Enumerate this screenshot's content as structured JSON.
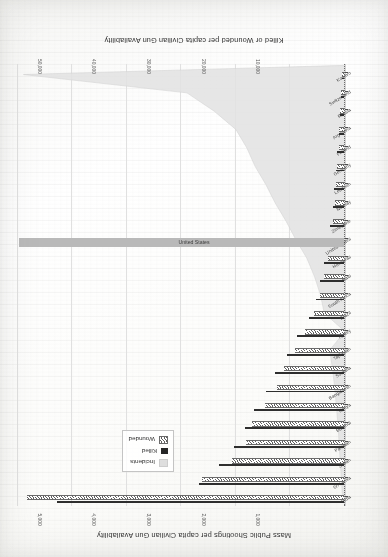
{
  "chart_data": {
    "type": "bar",
    "title": "",
    "orientation": "horizontal",
    "rotated_180": true,
    "grid": true,
    "legend_position": "upper-right",
    "axes": {
      "primary_bottom": {
        "label": "Killed or Wounded per capita  Civilian Gun Availability",
        "ticks": [
          "10,000",
          "20,000",
          "30,000",
          "40,000",
          "50,000",
          "60,000"
        ],
        "tick_values": [
          10000,
          20000,
          30000,
          40000,
          50000,
          60000
        ],
        "lim": [
          0,
          60000
        ]
      },
      "secondary_top": {
        "label": "Mass Public Shootings per capita Civilian Gun Availability",
        "ticks": [
          "1,000",
          "2,000",
          "3,000",
          "4,000",
          "5,000",
          "6,000"
        ],
        "tick_values": [
          1000,
          2000,
          3000,
          4000,
          5000,
          6000
        ],
        "lim": [
          0,
          6000
        ]
      },
      "category": {
        "label": ""
      }
    },
    "categories": [
      "India",
      "Sri Lanka",
      "Sudan",
      "Pakistan",
      "Burundi",
      "Kenya",
      "Bangladesh",
      "Somalia",
      "Tajikistan",
      "Turkey",
      "Brazil",
      "South Africa",
      "Haiti",
      "Honduras",
      "United States",
      "Zimbabwe",
      "Norway",
      "Lebanon",
      "Germany",
      "Finland",
      "Argentina",
      "Russia",
      "Switzerland",
      "Kosovo"
    ],
    "series": [
      {
        "name": "Killed",
        "axis": "primary_bottom",
        "marker": "black-bar",
        "color": "#2e2e2e",
        "values": [
          52500,
          26500,
          22800,
          20100,
          18200,
          16500,
          14300,
          12600,
          10500,
          8600,
          6400,
          5200,
          4300,
          3600,
          0,
          2500,
          2100,
          1800,
          1500,
          1200,
          1000,
          800,
          600,
          400
        ]
      },
      {
        "name": "Wounded",
        "axis": "primary_bottom",
        "marker": "hatched-bar",
        "color": "#5f5f5f",
        "values": [
          58000,
          26000,
          20500,
          18000,
          16800,
          14500,
          12200,
          11000,
          9000,
          7200,
          5400,
          4400,
          3600,
          3000,
          0,
          2100,
          1700,
          1400,
          1200,
          1000,
          850,
          700,
          520,
          330
        ]
      },
      {
        "name": "Incidents",
        "axis": "secondary_top",
        "marker": "light-gray-area",
        "color": "#dedede",
        "values": [
          5900,
          2900,
          2400,
          2000,
          1800,
          1650,
          1450,
          1280,
          1080,
          900,
          700,
          560,
          450,
          380,
          6000,
          280,
          230,
          190,
          160,
          130,
          110,
          90,
          65,
          45
        ]
      }
    ],
    "highlight": {
      "category": "United States",
      "label": "United States",
      "note": "full-width gray bar spanning the plot"
    }
  },
  "legend": {
    "items": [
      {
        "label": "Incidents",
        "swatch": "incidents-swatch"
      },
      {
        "label": "Killed",
        "swatch": "killed-swatch"
      },
      {
        "label": "Wounded",
        "swatch": "wounded-swatch"
      }
    ]
  },
  "colors": {
    "killed": "#2e2e2e",
    "wounded": "#5f5f5f",
    "incidents": "#dedede",
    "highlight_bar": "#b9b9b9",
    "grid": "#e0e0e0",
    "text": "#2f2f2f",
    "paper": "#fbfbf9"
  }
}
